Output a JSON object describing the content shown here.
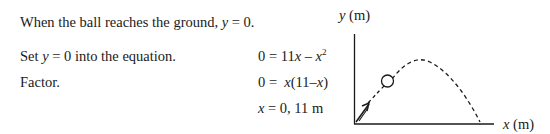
{
  "steps": {
    "intro": {
      "prefix": "When the ball reaches the ground, ",
      "var": "y",
      "suffix": " = 0."
    },
    "set": {
      "prefix": "Set ",
      "var": "y",
      "suffix": " = 0 into the equation."
    },
    "factor": {
      "label": "Factor."
    }
  },
  "equations": {
    "eq1": {
      "lhs": "0 = 11",
      "var1": "x",
      "minus": " – ",
      "var2": "x",
      "exp": "2"
    },
    "eq2": {
      "lhs": "0 =  ",
      "var1": "x",
      "mid": "(11–",
      "var2": "x",
      "close": ")"
    },
    "eq3": {
      "var": "x",
      "rhs": " = 0, 11 m"
    }
  },
  "graph": {
    "y_axis_var": "y",
    "y_axis_unit": " (m)",
    "x_axis_var": "x",
    "x_axis_unit": " (m)",
    "trajectory_style": "dashed",
    "ball": "circle",
    "launch_arrow": "velocity-vector"
  }
}
